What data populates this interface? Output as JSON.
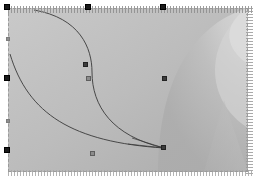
{
  "app": {
    "title": "Vector Editor Canvas",
    "tool": "node-editor",
    "document_background": "#b9b9b9",
    "selection_stroke": "#9a9a9a",
    "handle_color": "#1a1a1a",
    "node_color": "#8c8c8c",
    "path_stroke": "#3a3a3a"
  },
  "artboard": {
    "x": 8,
    "y": 8,
    "width": 240,
    "height": 164,
    "label": "artboard"
  },
  "gradient": {
    "type": "radial-bands",
    "stops": [
      {
        "offset": 0,
        "color": "#cfcfcf"
      },
      {
        "offset": 45,
        "color": "#bcbcbc"
      },
      {
        "offset": 70,
        "color": "#b0b0b0"
      },
      {
        "offset": 100,
        "color": "#a8a8a8"
      }
    ],
    "highlight_color": "#dadada",
    "band_color": "#c4c4c4",
    "wedge_color": "#b2b2b2"
  },
  "paths": [
    {
      "name": "s-curve",
      "d": "M 34 8 C 80 16 92 46 92 70 C 92 104 112 134 164 146",
      "stroke": "#3a3a3a",
      "stroke_width": 0.9,
      "fill": "none"
    },
    {
      "name": "lower-arc",
      "d": "M 8 52 C 26 112 72 140 164 146",
      "stroke": "#3a3a3a",
      "stroke_width": 0.9,
      "fill": "none"
    },
    {
      "name": "tangent-handle-upper",
      "d": "M 132 136 L 164 146",
      "stroke": "#3a3a3a",
      "stroke_width": 0.7,
      "fill": "none"
    },
    {
      "name": "tangent-handle-lower",
      "d": "M 128 142 L 164 146",
      "stroke": "#3a3a3a",
      "stroke_width": 0.7,
      "fill": "none"
    }
  ],
  "handles": [
    {
      "name": "handle-top-left",
      "x": 5,
      "y": 5,
      "size": "large"
    },
    {
      "name": "handle-top-center",
      "x": 86,
      "y": 5,
      "size": "large"
    },
    {
      "name": "handle-top-right",
      "x": 161,
      "y": 5,
      "size": "large"
    },
    {
      "name": "handle-middle-left",
      "x": 5,
      "y": 76,
      "size": "large"
    },
    {
      "name": "handle-bottom-left",
      "x": 5,
      "y": 148,
      "size": "large"
    },
    {
      "name": "handle-edge-left-upper",
      "x": 7,
      "y": 38,
      "size": "small"
    },
    {
      "name": "handle-edge-left-lower",
      "x": 7,
      "y": 120,
      "size": "small"
    }
  ],
  "nodes": [
    {
      "name": "node-curve-mid",
      "x": 86,
      "y": 76,
      "style": "normal"
    },
    {
      "name": "node-curve-right",
      "x": 162,
      "y": 76,
      "style": "dark"
    },
    {
      "name": "node-curve-bottom",
      "x": 90,
      "y": 152,
      "style": "normal"
    },
    {
      "name": "node-anchor-end",
      "x": 170,
      "y": 152,
      "style": "dark"
    },
    {
      "name": "node-inflection",
      "x": 82,
      "y": 63,
      "style": "dark"
    }
  ],
  "decorations": {
    "hatch_top_label": "ruler-hatch-top",
    "hatch_right_label": "ruler-hatch-right",
    "hatch_bottom_label": "ruler-hatch-bottom"
  }
}
